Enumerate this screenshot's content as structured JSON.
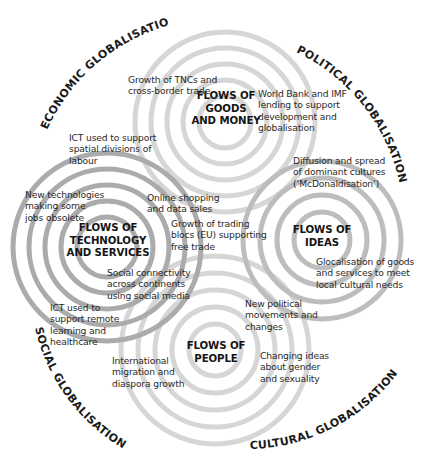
{
  "arcs": {
    "economic": "ECONOMIC GLOBALISATION",
    "political": "POLITICAL GLOBALISATION",
    "social": "SOCIAL GLOBALISATION",
    "cultural": "CULTURAL GLOBALISATION"
  },
  "hubs": {
    "goods_money": "FLOWS OF\nGOODS\nAND MONEY",
    "technology_services": "FLOWS OF\nTECHNOLOGY\nAND SERVICES",
    "ideas": "FLOWS OF\nIDEAS",
    "people": "FLOWS OF\nPEOPLE"
  },
  "labels": {
    "tncs": "Growth of TNCs and\ncross-border trade",
    "world_bank": "World Bank and IMF\nlending to support\ndevelopment and\nglobalisation",
    "ict_labour": "ICT used to support\nspatial divisions of\nlabour",
    "new_tech": "New technologies\nmaking some\njobs obsolete",
    "online_shopping": "Online shopping\nand data sales",
    "trading_blocs": "Growth of trading\nblocs (EU) supporting\nfree trade",
    "diffusion": "Diffusion and spread\nof dominant cultures\n(‘McDonaldisation’)",
    "glocalisation": "Glocalisation of goods\nand services to meet\nlocal cultural needs",
    "social_connectivity": "Social connectivity\nacross continents\nusing social media",
    "ict_remote": "ICT used to\nsupport remote\nlearning and\nhealthcare",
    "political_movements": "New political\nmovements and\nchanges",
    "migration": "International\nmigration and\ndiaspora growth",
    "gender": "Changing ideas\nabout gender\nand sexuality"
  },
  "colors": {
    "ring_light": "#d4d4d4",
    "ring_dark": "#a9a9a9",
    "text": "#2a2a2a"
  }
}
